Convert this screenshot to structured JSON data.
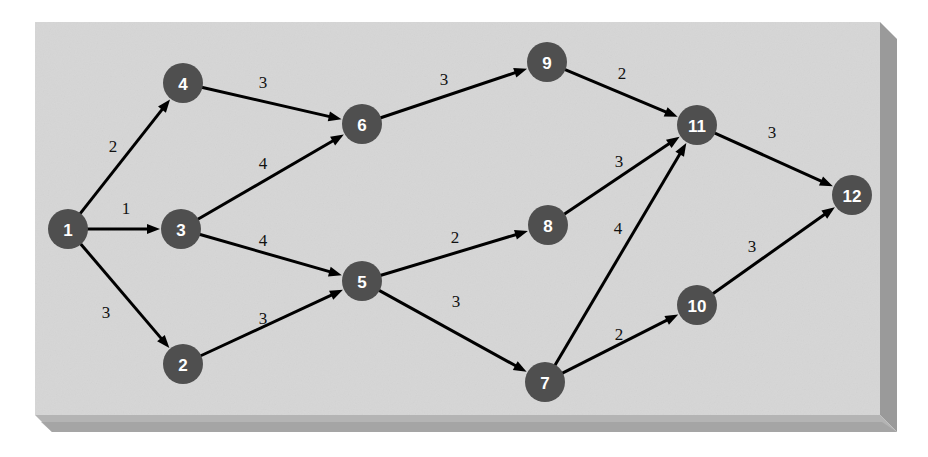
{
  "figure": {
    "type": "weighted-directed-graph",
    "background_color": "#ffffff",
    "panel": {
      "face_color": "#d6d6d6",
      "edge_right_color": "#9a9a9a",
      "edge_bottom_color": "#b4b4b4",
      "edge_bottom_dark_color": "#a0a0a0",
      "x": 35,
      "y": 22,
      "width": 845,
      "height": 393,
      "depth": 17
    },
    "node_style": {
      "fill_color": "#4f4f4f",
      "label_color": "#ffffff",
      "radius": 20,
      "font_size": 17
    },
    "edge_style": {
      "line_color": "#000000",
      "line_width": 3,
      "weight_font_size": 17,
      "weight_color": "#111111",
      "arrow_length": 13,
      "arrow_half_width": 5
    }
  },
  "chart_data": {
    "type": "diagram",
    "title": "",
    "node_count": 12,
    "edge_count": 15,
    "nodes": [
      {
        "id": "1",
        "label": "1",
        "x": 68,
        "y": 229
      },
      {
        "id": "2",
        "label": "2",
        "x": 183,
        "y": 364
      },
      {
        "id": "3",
        "label": "3",
        "x": 181,
        "y": 229
      },
      {
        "id": "4",
        "label": "4",
        "x": 183,
        "y": 83
      },
      {
        "id": "5",
        "label": "5",
        "x": 362,
        "y": 281
      },
      {
        "id": "6",
        "label": "6",
        "x": 362,
        "y": 124
      },
      {
        "id": "7",
        "label": "7",
        "x": 545,
        "y": 382
      },
      {
        "id": "8",
        "label": "8",
        "x": 548,
        "y": 225
      },
      {
        "id": "9",
        "label": "9",
        "x": 547,
        "y": 62
      },
      {
        "id": "10",
        "label": "10",
        "x": 697,
        "y": 305
      },
      {
        "id": "11",
        "label": "11",
        "x": 697,
        "y": 125
      },
      {
        "id": "12",
        "label": "12",
        "x": 852,
        "y": 195
      }
    ],
    "edges": [
      {
        "from": "1",
        "to": "4",
        "weight": "2",
        "label_x": 113,
        "label_y": 146
      },
      {
        "from": "1",
        "to": "3",
        "weight": "1",
        "label_x": 126,
        "label_y": 208
      },
      {
        "from": "1",
        "to": "2",
        "weight": "3",
        "label_x": 106,
        "label_y": 312
      },
      {
        "from": "4",
        "to": "6",
        "weight": "3",
        "label_x": 263,
        "label_y": 82
      },
      {
        "from": "3",
        "to": "6",
        "weight": "4",
        "label_x": 263,
        "label_y": 163
      },
      {
        "from": "3",
        "to": "5",
        "weight": "4",
        "label_x": 263,
        "label_y": 240
      },
      {
        "from": "2",
        "to": "5",
        "weight": "3",
        "label_x": 263,
        "label_y": 318
      },
      {
        "from": "6",
        "to": "9",
        "weight": "3",
        "label_x": 444,
        "label_y": 79
      },
      {
        "from": "9",
        "to": "11",
        "weight": "2",
        "label_x": 622,
        "label_y": 73
      },
      {
        "from": "5",
        "to": "8",
        "weight": "2",
        "label_x": 455,
        "label_y": 237
      },
      {
        "from": "5",
        "to": "7",
        "weight": "3",
        "label_x": 456,
        "label_y": 301
      },
      {
        "from": "8",
        "to": "11",
        "weight": "3",
        "label_x": 619,
        "label_y": 161
      },
      {
        "from": "7",
        "to": "11",
        "weight": "4",
        "label_x": 618,
        "label_y": 228
      },
      {
        "from": "7",
        "to": "10",
        "weight": "2",
        "label_x": 619,
        "label_y": 334
      },
      {
        "from": "11",
        "to": "12",
        "weight": "3",
        "label_x": 772,
        "label_y": 132
      },
      {
        "from": "10",
        "to": "12",
        "weight": "3",
        "label_x": 752,
        "label_y": 246
      }
    ]
  }
}
